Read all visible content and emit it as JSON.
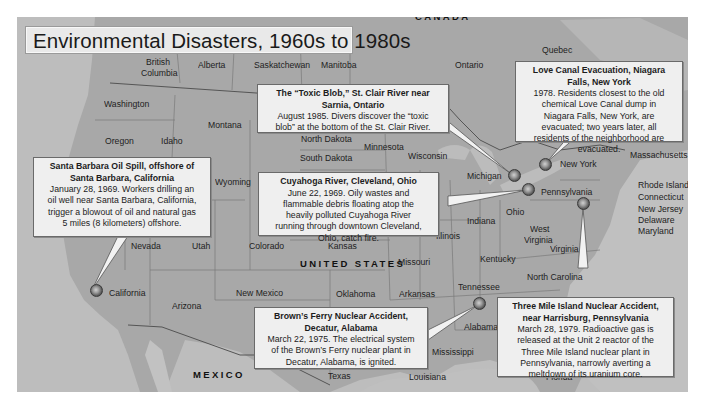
{
  "title": "Environmental Disasters, 1960s to 1980s",
  "countries": [
    {
      "name": "CANADA",
      "x": 415,
      "y": 16
    },
    {
      "name": "UNITED STATES",
      "x": 300,
      "y": 263
    },
    {
      "name": "MEXICO",
      "x": 193,
      "y": 374
    }
  ],
  "region_labels": [
    {
      "name": "British",
      "x": 146,
      "y": 62
    },
    {
      "name": "Columbia",
      "x": 141,
      "y": 73
    },
    {
      "name": "Alberta",
      "x": 198,
      "y": 65
    },
    {
      "name": "Saskatchewan",
      "x": 254,
      "y": 65
    },
    {
      "name": "Manitoba",
      "x": 321,
      "y": 65
    },
    {
      "name": "Ontario",
      "x": 455,
      "y": 65
    },
    {
      "name": "Quebec",
      "x": 542,
      "y": 50
    },
    {
      "name": "Washington",
      "x": 104,
      "y": 104
    },
    {
      "name": "Montana",
      "x": 208,
      "y": 125
    },
    {
      "name": "Oregon",
      "x": 105,
      "y": 141
    },
    {
      "name": "Idaho",
      "x": 161,
      "y": 141
    },
    {
      "name": "North Dakota",
      "x": 301,
      "y": 139
    },
    {
      "name": "South Dakota",
      "x": 300,
      "y": 158
    },
    {
      "name": "Minnesota",
      "x": 364,
      "y": 147
    },
    {
      "name": "Wisconsin",
      "x": 408,
      "y": 156
    },
    {
      "name": "Wyoming",
      "x": 215,
      "y": 182
    },
    {
      "name": "Michigan",
      "x": 467,
      "y": 176
    },
    {
      "name": "New York",
      "x": 560,
      "y": 164
    },
    {
      "name": "Massachusetts",
      "x": 630,
      "y": 155
    },
    {
      "name": "Pennsylvania",
      "x": 541,
      "y": 192
    },
    {
      "name": "Rhode Island",
      "x": 638,
      "y": 185
    },
    {
      "name": "Connecticut",
      "x": 638,
      "y": 197
    },
    {
      "name": "New Jersey",
      "x": 638,
      "y": 209
    },
    {
      "name": "Delaware",
      "x": 638,
      "y": 220
    },
    {
      "name": "Maryland",
      "x": 638,
      "y": 231
    },
    {
      "name": "Ohio",
      "x": 506,
      "y": 212
    },
    {
      "name": "Indiana",
      "x": 467,
      "y": 221
    },
    {
      "name": "West",
      "x": 530,
      "y": 229
    },
    {
      "name": "Virginia",
      "x": 524,
      "y": 240
    },
    {
      "name": "Illinois",
      "x": 436,
      "y": 236
    },
    {
      "name": "Virginia",
      "x": 550,
      "y": 249
    },
    {
      "name": "Nevada",
      "x": 131,
      "y": 246
    },
    {
      "name": "Utah",
      "x": 192,
      "y": 246
    },
    {
      "name": "Colorado",
      "x": 249,
      "y": 246
    },
    {
      "name": "Kansas",
      "x": 328,
      "y": 246
    },
    {
      "name": "Kentucky",
      "x": 480,
      "y": 259
    },
    {
      "name": "Missouri",
      "x": 398,
      "y": 262
    },
    {
      "name": "North Carolina",
      "x": 527,
      "y": 277
    },
    {
      "name": "California",
      "x": 109,
      "y": 293
    },
    {
      "name": "New Mexico",
      "x": 236,
      "y": 293
    },
    {
      "name": "Oklahoma",
      "x": 336,
      "y": 294
    },
    {
      "name": "Arkansas",
      "x": 399,
      "y": 294
    },
    {
      "name": "Tennessee",
      "x": 458,
      "y": 287
    },
    {
      "name": "Arizona",
      "x": 172,
      "y": 306
    },
    {
      "name": "Alabama",
      "x": 464,
      "y": 327
    },
    {
      "name": "Mississippi",
      "x": 432,
      "y": 352
    },
    {
      "name": "Texas",
      "x": 328,
      "y": 376
    },
    {
      "name": "Louisiana",
      "x": 409,
      "y": 377
    },
    {
      "name": "Florida",
      "x": 546,
      "y": 377
    }
  ],
  "callouts": [
    {
      "id": "toxic-blob",
      "title": "The “Toxic Blob,” St. Clair River near Sarnia, Ontario",
      "body": "August 1985. Divers discover the “toxic blob” at the bottom of the St. Clair River."
    },
    {
      "id": "love-canal",
      "title": "Love Canal Evacuation, Niagara Falls, New York",
      "body": "1978. Residents closest to the old chemical Love Canal dump in Niagara Falls, New York, are evacuated; two years later, all residents of the neighborhood are evacuated."
    },
    {
      "id": "santa-barbara",
      "title": "Santa Barbara Oil Spill, offshore of Santa Barbara, California",
      "body": "January 28, 1969. Workers drilling an oil well near Santa Barbara, California, trigger a blowout of oil and natural gas 5 miles (8 kilometers) offshore."
    },
    {
      "id": "cuyahoga",
      "title": "Cuyahoga River, Cleveland, Ohio",
      "body": "June 22, 1969. Oily wastes and flammable debris floating atop the heavily polluted Cuyahoga River running through downtown Cleveland, Ohio, catch fire."
    },
    {
      "id": "browns-ferry",
      "title": "Brown’s Ferry Nuclear Accident, Decatur, Alabama",
      "body": "March 22, 1975. The electrical system of the Brown’s Ferry nuclear plant in Decatur, Alabama, is ignited."
    },
    {
      "id": "three-mile-island",
      "title": "Three Mile Island Nuclear Accident, near Harrisburg, Pennsylvania",
      "body": "March 28, 1979. Radioactive gas is released at the Unit 2 reactor of the Three Mile Island nuclear plant in Pennsylvania, narrowly averting a meltdown of its uranium core."
    }
  ],
  "markers": [
    {
      "id": "santa-barbara",
      "x": 86,
      "y": 290
    },
    {
      "id": "toxic-blob",
      "x": 511,
      "y": 175
    },
    {
      "id": "love-canal",
      "x": 545,
      "y": 165
    },
    {
      "id": "cuyahoga",
      "x": 528,
      "y": 189
    },
    {
      "id": "three-mile-island",
      "x": 583,
      "y": 203
    },
    {
      "id": "browns-ferry",
      "x": 479,
      "y": 303
    }
  ],
  "colors": {
    "land": "#a9a9a9",
    "water": "#c4c4c4",
    "callout_bg": "#efefef",
    "border": "#555555"
  }
}
